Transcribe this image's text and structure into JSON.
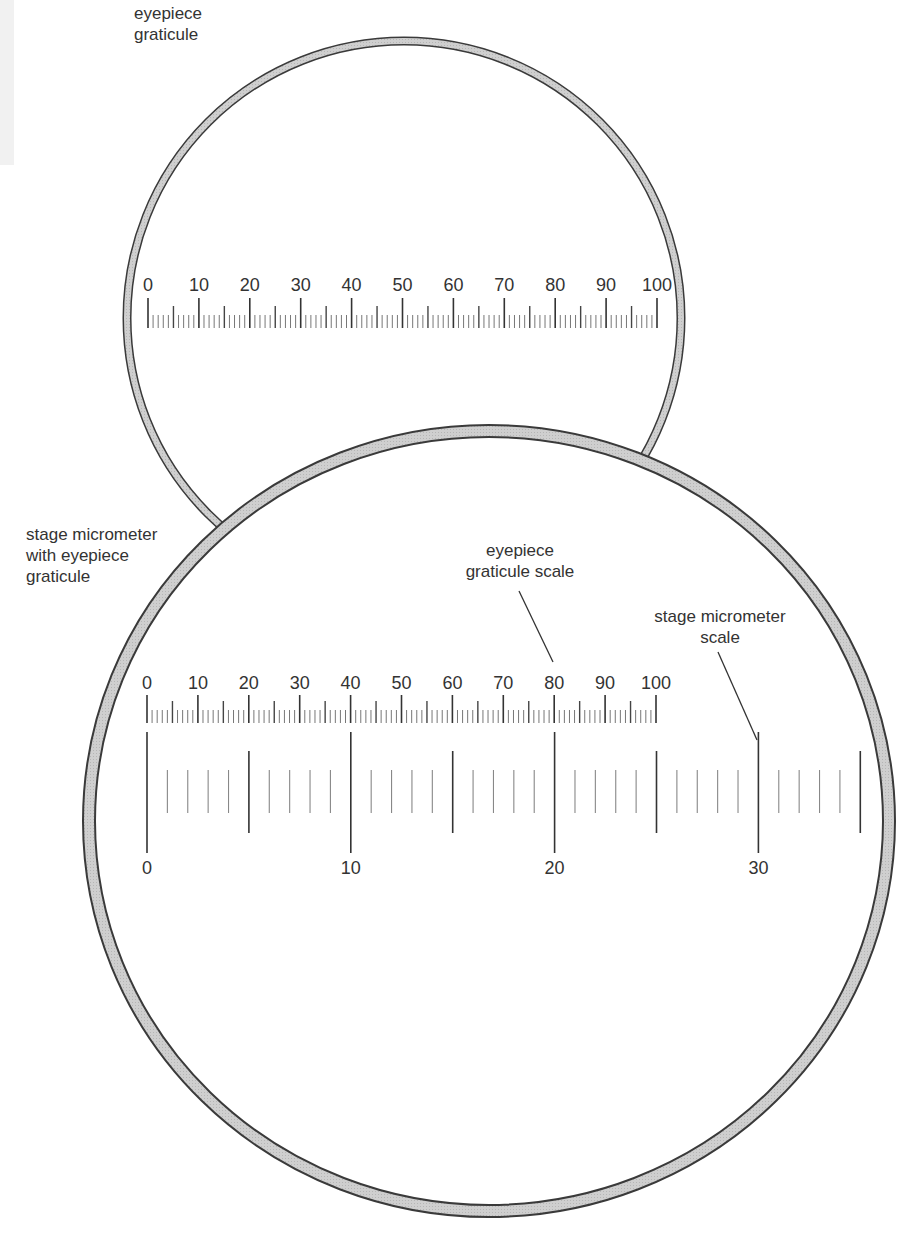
{
  "diagram": {
    "colors": {
      "ink": "#333333",
      "rim_fill": "#c8c8c8",
      "rim_stroke": "#3a3a3a",
      "background": "#ffffff"
    }
  },
  "labels": {
    "eyepiece_graticule": [
      "eyepiece",
      "graticule"
    ],
    "stage_with_graticule": [
      "stage micrometer",
      "with eyepiece",
      "graticule"
    ],
    "eyepiece_scale_callout": [
      "eyepiece",
      "graticule scale"
    ],
    "stage_scale_callout": [
      "stage micrometer",
      "scale"
    ]
  },
  "eyepiece_graticule_scale": {
    "min": 0,
    "max": 100,
    "minor_step": 1,
    "medium_step": 5,
    "major_step": 10,
    "tick_labels": [
      "0",
      "10",
      "20",
      "30",
      "40",
      "50",
      "60",
      "70",
      "80",
      "90",
      "100"
    ]
  },
  "stage_micrometer_scale": {
    "min": 0,
    "max": 35,
    "minor_step": 1,
    "medium_step": 5,
    "major_step": 10,
    "tick_labels": [
      "0",
      "10",
      "20",
      "30"
    ]
  },
  "alignment": {
    "eyepiece_units_per_stage_unit": 4,
    "note": "eyepiece 0 aligned with stage 0; eyepiece 40 ≈ stage 10; eyepiece 80 ≈ stage 20"
  }
}
